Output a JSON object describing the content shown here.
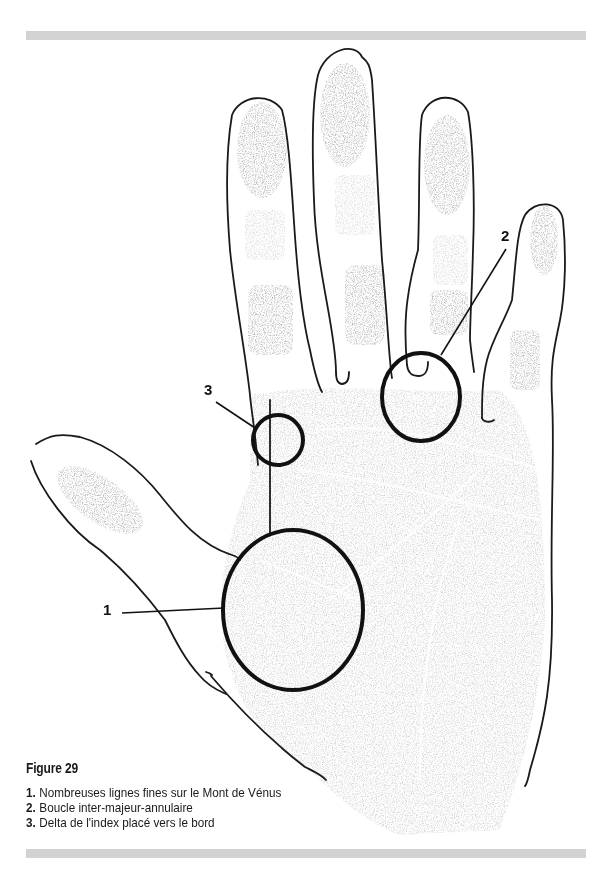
{
  "figure": {
    "title": "Figure 29",
    "legend": [
      {
        "number": "1.",
        "text": "Nombreuses lignes fines sur le Mont de Vénus"
      },
      {
        "number": "2.",
        "text": "Boucle inter-majeur-annulaire"
      },
      {
        "number": "3.",
        "text": "Delta de l'index placé vers le bord"
      }
    ]
  },
  "callouts": [
    {
      "label": "1",
      "description": "Mont de Vénus circle"
    },
    {
      "label": "2",
      "description": "Inter-majeur-annulaire loop circle"
    },
    {
      "label": "3",
      "description": "Index delta circle"
    }
  ],
  "colors": {
    "rule": "#d2d2d2",
    "outline": "#1a1a1a",
    "print": "#8a8a8a",
    "text": "#1a1a1a"
  }
}
